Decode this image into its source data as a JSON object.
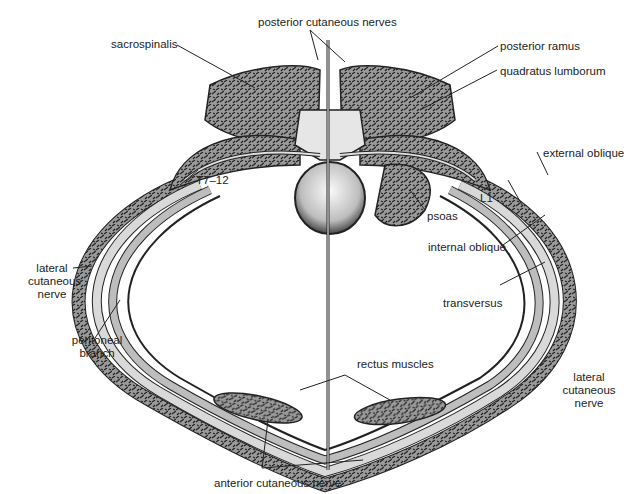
{
  "figure": {
    "labels": {
      "posterior_cutaneous_nerves": "posterior cutaneous nerves",
      "sacrospinalis": "sacrospinalis",
      "posterior_ramus": "posterior ramus",
      "quadratus_lumborum": "quadratus lumborum",
      "external_oblique": "external oblique",
      "t7_12": "T7–12",
      "l1": "L1",
      "psoas": "psoas",
      "internal_oblique": "internal oblique",
      "lateral_cutaneous_nerve_left_1": "lateral",
      "lateral_cutaneous_nerve_left_2": "cutaneous",
      "lateral_cutaneous_nerve_left_3": "nerve",
      "transversus": "transversus",
      "peritoneal_branch_1": "peritoneal",
      "peritoneal_branch_2": "branch",
      "rectus_muscles": "rectus muscles",
      "lateral_cutaneous_nerve_right_1": "lateral",
      "lateral_cutaneous_nerve_right_2": "cutaneous",
      "lateral_cutaneous_nerve_right_3": "nerve",
      "anterior_cutaneous_nerve": "anterior cutaneous nerve"
    },
    "colors": {
      "muscle_fill": "#8a8a8a",
      "muscle_light": "#c8c8c8",
      "nerve": "#d9d9d9",
      "outline": "#222222",
      "vertebra": "#e6e6e6"
    }
  }
}
